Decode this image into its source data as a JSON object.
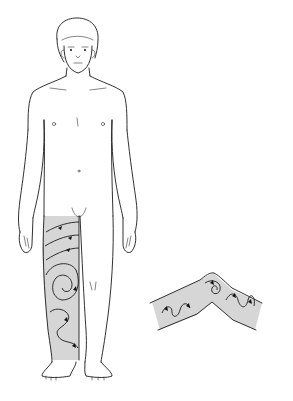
{
  "figure": {
    "colors": {
      "line": "#1a1a1a",
      "shade": "#d6d6d6",
      "background": "#ffffff"
    },
    "regions": [
      {
        "name": "body-figure",
        "label": ""
      },
      {
        "name": "shaded-leg",
        "label": ""
      },
      {
        "name": "bent-joint-inset",
        "label": ""
      }
    ]
  }
}
